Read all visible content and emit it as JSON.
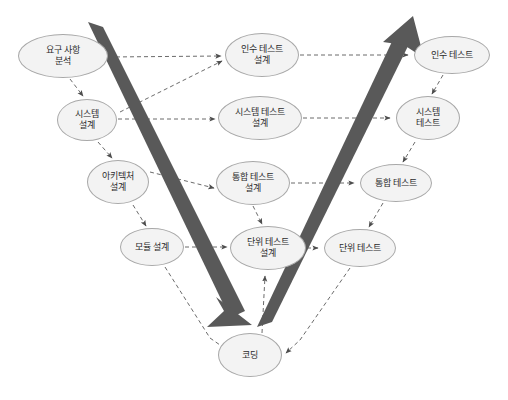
{
  "diagram": {
    "background_color": "#ffffff",
    "node_fill": "#f3f3f3",
    "node_stroke": "#a8a8a8",
    "arrow_color": "#4d4d4d",
    "band_color": "#595959",
    "dashed_color": "#6b6b6b"
  },
  "nodes": {
    "requirements_analysis": {
      "label": "요구 사항\n분석",
      "cx": 63,
      "cy": 56,
      "w": 90,
      "h": 44
    },
    "system_design": {
      "label": "시스템\n설계",
      "cx": 87,
      "cy": 120,
      "w": 60,
      "h": 42
    },
    "architecture_design": {
      "label": "아키텍처\n설계",
      "cx": 118,
      "cy": 182,
      "w": 62,
      "h": 44
    },
    "module_design": {
      "label": "모듈 설계",
      "cx": 152,
      "cy": 247,
      "w": 64,
      "h": 38
    },
    "acceptance_test_design": {
      "label": "인수 테스트\n설계",
      "cx": 262,
      "cy": 55,
      "w": 74,
      "h": 44
    },
    "system_test_design": {
      "label": "시스템 테스트\n설계",
      "cx": 260,
      "cy": 118,
      "w": 84,
      "h": 44
    },
    "integration_test_design": {
      "label": "통합 테스트\n설계",
      "cx": 253,
      "cy": 183,
      "w": 74,
      "h": 44
    },
    "unit_test_design": {
      "label": "단위 테스트\n설계",
      "cx": 268,
      "cy": 248,
      "w": 76,
      "h": 44
    },
    "acceptance_test": {
      "label": "인수 테스트",
      "cx": 452,
      "cy": 55,
      "w": 76,
      "h": 38
    },
    "system_test": {
      "label": "시스템\n테스트",
      "cx": 428,
      "cy": 118,
      "w": 64,
      "h": 44
    },
    "integration_test": {
      "label": "통합 테스트",
      "cx": 396,
      "cy": 183,
      "w": 72,
      "h": 38
    },
    "unit_test": {
      "label": "단위 테스트",
      "cx": 360,
      "cy": 248,
      "w": 72,
      "h": 38
    },
    "coding": {
      "label": "코딩",
      "cx": 250,
      "cy": 355,
      "w": 64,
      "h": 44
    }
  },
  "bands": {
    "left_band": {
      "from_x": 95,
      "from_y": 22,
      "to_x": 243,
      "to_y": 318,
      "label": "descending-verification-band"
    },
    "right_band": {
      "from_x": 264,
      "from_y": 325,
      "to_x": 413,
      "to_y": 20,
      "label": "ascending-validation-band"
    }
  }
}
